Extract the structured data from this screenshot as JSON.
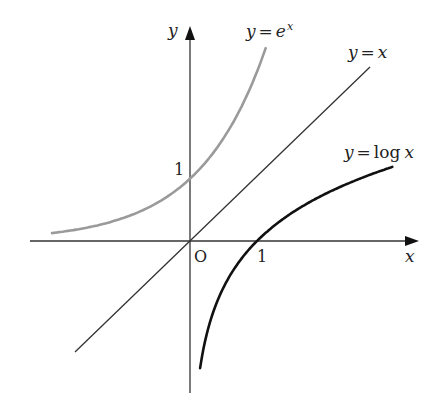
{
  "diagram": {
    "axes": {
      "x_label": "x",
      "y_label": "y",
      "origin_label": "O",
      "x_tick_label": "1",
      "y_tick_label": "1"
    },
    "curves": [
      {
        "name": "exp",
        "label_y": "y",
        "label_eq": "=",
        "label_base": "e",
        "label_exp": "x",
        "color": "#9a9a9a"
      },
      {
        "name": "identity",
        "label_y": "y",
        "label_eq": "=",
        "label_rhs": "x",
        "color": "#333333"
      },
      {
        "name": "log",
        "label_y": "y",
        "label_eq": "=",
        "label_fn": "log",
        "label_arg": "x",
        "color": "#111111"
      }
    ]
  }
}
